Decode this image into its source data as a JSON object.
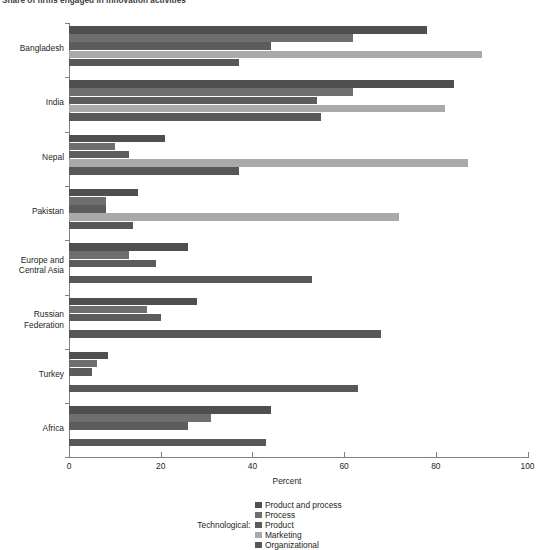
{
  "title": "Share of firms engaged in innovation activities",
  "x_axis_title": "Percent",
  "legend": {
    "prefix": "Technological:",
    "items": [
      {
        "label": "Product and process",
        "color": "#4f4f4f"
      },
      {
        "label": "Process",
        "color": "#6e6e6e"
      },
      {
        "label": "Product",
        "color": "#5c5c5c"
      },
      {
        "label": "Marketing",
        "color": "#a9a9a9"
      },
      {
        "label": "Organizational",
        "color": "#575757"
      }
    ]
  },
  "chart_data": {
    "type": "bar",
    "orientation": "horizontal",
    "title": "Share of firms engaged in innovation activities",
    "xlabel": "Percent",
    "ylabel": "",
    "xlim": [
      0,
      100
    ],
    "xticks": [
      0,
      20,
      40,
      60,
      80,
      100
    ],
    "grid": false,
    "legend_position": "bottom",
    "categories": [
      "Bangladesh",
      "India",
      "Nepal",
      "Pakistan",
      "Europe and Central Asia",
      "Russian Federation",
      "Turkey",
      "Africa"
    ],
    "series": [
      {
        "name": "Product and process",
        "color": "#4f4f4f",
        "values": [
          78,
          84,
          21,
          15,
          26,
          28,
          8.5,
          44
        ]
      },
      {
        "name": "Process",
        "color": "#6e6e6e",
        "values": [
          62,
          62,
          10,
          8,
          13,
          17,
          6,
          31
        ]
      },
      {
        "name": "Product",
        "color": "#5c5c5c",
        "values": [
          44,
          54,
          13,
          8,
          19,
          20,
          5,
          26
        ]
      },
      {
        "name": "Marketing",
        "color": "#a9a9a9",
        "values": [
          90,
          82,
          87,
          72,
          0,
          0,
          0,
          0
        ]
      },
      {
        "name": "Organizational",
        "color": "#575757",
        "values": [
          37,
          55,
          37,
          14,
          53,
          68,
          63,
          43
        ]
      }
    ]
  },
  "category_labels": [
    {
      "lines": [
        "Bangladesh"
      ]
    },
    {
      "lines": [
        "India"
      ]
    },
    {
      "lines": [
        "Nepal"
      ]
    },
    {
      "lines": [
        "Pakistan"
      ]
    },
    {
      "lines": [
        "Europe and",
        "Central Asia"
      ]
    },
    {
      "lines": [
        "Russian",
        "Federation"
      ]
    },
    {
      "lines": [
        "Turkey"
      ]
    },
    {
      "lines": [
        "Africa"
      ]
    }
  ]
}
